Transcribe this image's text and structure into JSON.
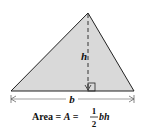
{
  "diagram": {
    "shape": "triangle",
    "fill_color": "#d9d9d9",
    "stroke_color": "#222222",
    "labels": {
      "height": "h",
      "base": "b"
    },
    "formula": {
      "prefix": "Area = ",
      "variable": "A",
      "equals": " = ",
      "numerator": "1",
      "denominator": "2",
      "suffix": "bh"
    }
  }
}
